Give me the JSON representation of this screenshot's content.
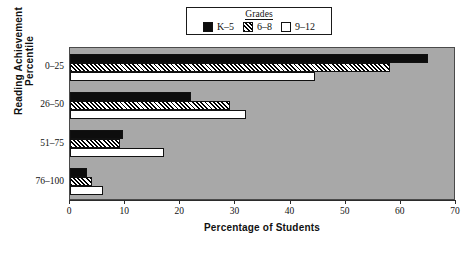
{
  "chart_data": {
    "type": "bar",
    "orientation": "horizontal",
    "title": "",
    "subtitle": "",
    "xlabel": "Percentage of Students",
    "ylabel": "Reading Achievement Percentile",
    "categories": [
      "0–25",
      "26–50",
      "51–75",
      "76–100"
    ],
    "series": [
      {
        "name": "K–5",
        "values": [
          65.0,
          22.0,
          9.7,
          3.0
        ],
        "fill": "solid",
        "color": "#0d0d0d"
      },
      {
        "name": "6–8",
        "values": [
          58.0,
          29.0,
          9.0,
          4.0
        ],
        "fill": "hatch",
        "color": "#ffffff"
      },
      {
        "name": "9–12",
        "values": [
          44.5,
          32.0,
          17.0,
          6.0
        ],
        "fill": "open",
        "color": "#ffffff"
      }
    ],
    "xlim": [
      0,
      70
    ],
    "xticks": [
      0,
      10,
      20,
      30,
      40,
      50,
      60,
      70
    ],
    "xtick_labels": [
      "0",
      "10",
      "20",
      "30",
      "40",
      "50",
      "60",
      "70"
    ],
    "grid": false,
    "legend": {
      "title": "Grades",
      "position": "top-center"
    },
    "plot_background": "#a8a8a8",
    "figure_background": "#ffffff"
  },
  "legend": {
    "title": "Grades",
    "entries": [
      {
        "label": "K–5"
      },
      {
        "label": "6–8"
      },
      {
        "label": "9–12"
      }
    ]
  },
  "axes": {
    "x": {
      "title": "Percentage of Students",
      "ticks": [
        "0",
        "10",
        "20",
        "30",
        "40",
        "50",
        "60",
        "70"
      ]
    },
    "y": {
      "title": "Reading Achievement Percentile",
      "ticks": [
        "0–25",
        "26–50",
        "51–75",
        "76–100"
      ]
    }
  }
}
